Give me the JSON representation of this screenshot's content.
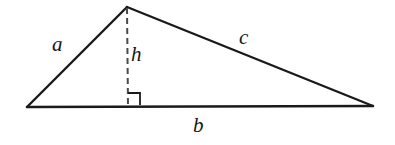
{
  "figure": {
    "canvas": {
      "width": 395,
      "height": 145,
      "background": "#ffffff"
    },
    "stroke_color": "#1a1a1a",
    "stroke_width": 2.2,
    "dash_color": "#4a4a4a",
    "vertices": {
      "left": {
        "x": 27,
        "y": 107
      },
      "apex": {
        "x": 127,
        "y": 7
      },
      "right": {
        "x": 373,
        "y": 106
      }
    },
    "altitude": {
      "from": {
        "x": 127,
        "y": 7
      },
      "to": {
        "x": 128,
        "y": 107
      },
      "style": "dashed",
      "dash_pattern": "6 4"
    },
    "right_angle_marker": {
      "x": 128,
      "y": 93,
      "size": 12,
      "orientation": "opens-right"
    },
    "labels": {
      "side_a": "a",
      "side_b": "b",
      "side_c": "c",
      "height": "h"
    }
  }
}
